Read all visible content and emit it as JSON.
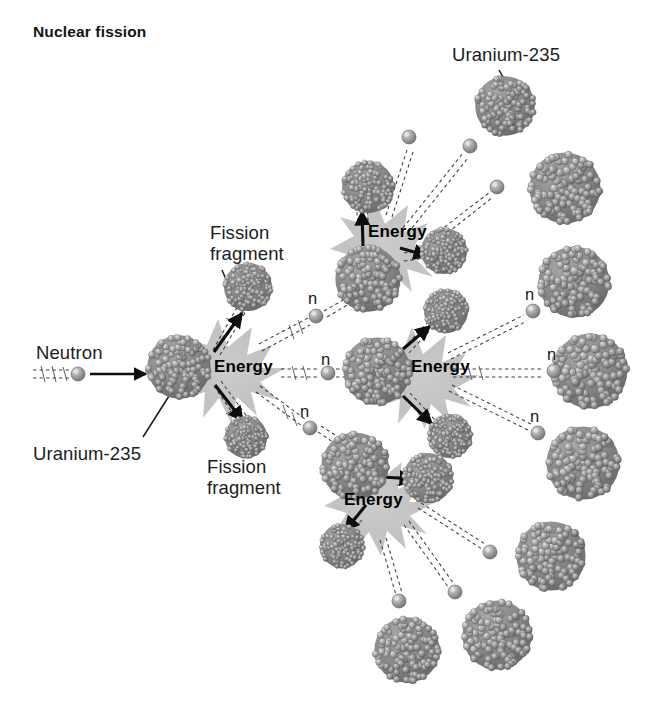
{
  "figure": {
    "title": "Nuclear fission",
    "domain_kind": "diagram",
    "background_color": "#ffffff",
    "nucleus_color": "#7e7e7e",
    "nucleus_highlight_color": "#b9b9b9",
    "burst_color": "#bdbdbd",
    "arrow_color": "#0d0d0d",
    "text_color": "#141414"
  },
  "labels": {
    "neutron": "Neutron",
    "uranium_left": "Uranium-235",
    "uranium_top": "Uranium-235",
    "fission_fragment_top": "Fission\nfragment",
    "fission_fragment_top_line1": "Fission",
    "fission_fragment_top_line2": "fragment",
    "fission_fragment_bottom_line1": "Fission",
    "fission_fragment_bottom_line2": "fragment",
    "energy_1": "Energy",
    "energy_2": "Energy",
    "energy_3": "Energy",
    "energy_4": "Energy",
    "neutron_symbol_1": "n",
    "neutron_symbol_2": "n",
    "neutron_symbol_3": "n",
    "neutron_symbol_4": "n",
    "neutron_symbol_5": "n",
    "neutron_symbol_6": "n"
  },
  "chart_data": {
    "type": "diagram",
    "title": "Nuclear fission",
    "subtitle": "",
    "generations": 3,
    "neutrons_released_per_fission": 3,
    "fission_events": [
      {
        "id": "fission-1",
        "generation": 1,
        "energy_label": "Energy",
        "nucleus": {
          "cx": 179,
          "cy": 367,
          "r": 33
        },
        "burst": {
          "cx": 218,
          "cy": 367,
          "r": 48
        },
        "fragments": [
          {
            "cx": 248,
            "cy": 287,
            "r": 25
          },
          {
            "cx": 246,
            "cy": 437,
            "r": 22
          }
        ],
        "emitted_neutrons": [
          "n-1",
          "n-2",
          "n-3"
        ]
      },
      {
        "id": "fission-2",
        "generation": 2,
        "energy_label": "Energy",
        "nucleus": {
          "cx": 368,
          "cy": 279,
          "r": 34
        },
        "burst": {
          "cx": 374,
          "cy": 243,
          "r": 46
        },
        "fragments": [
          {
            "cx": 368,
            "cy": 187,
            "r": 27
          },
          {
            "cx": 444,
            "cy": 251,
            "r": 24
          }
        ],
        "emitted_neutrons": [
          "n-4",
          "n-top-a",
          "n-top-b"
        ]
      },
      {
        "id": "fission-3",
        "generation": 2,
        "energy_label": "Energy",
        "nucleus": {
          "cx": 377,
          "cy": 371,
          "r": 35
        },
        "burst": {
          "cx": 412,
          "cy": 373,
          "r": 46
        },
        "fragments": [
          {
            "cx": 446,
            "cy": 311,
            "r": 23
          },
          {
            "cx": 450,
            "cy": 436,
            "r": 23
          }
        ],
        "emitted_neutrons": [
          "n-5",
          "n-6"
        ]
      },
      {
        "id": "fission-4",
        "generation": 2,
        "energy_label": "Energy",
        "nucleus": {
          "cx": 355,
          "cy": 466,
          "r": 35
        },
        "burst": {
          "cx": 368,
          "cy": 500,
          "r": 46
        },
        "fragments": [
          {
            "cx": 428,
            "cy": 478,
            "r": 26
          },
          {
            "cx": 342,
            "cy": 546,
            "r": 23
          }
        ],
        "emitted_neutrons": [
          "n-bot-a",
          "n-bot-b",
          "n-bot-c"
        ]
      }
    ],
    "incoming_neutron": {
      "label": "Neutron",
      "trail_start_x": 33,
      "trail_end_x": 70,
      "sphere": {
        "cx": 78,
        "cy": 374,
        "r": 7
      },
      "arrow_from_x": 90,
      "arrow_to_x": 148,
      "arrow_y": 374
    },
    "free_neutrons": [
      {
        "id": "n-1",
        "label": "n",
        "cx": 316,
        "cy": 316,
        "r": 7
      },
      {
        "id": "n-2",
        "label": "n",
        "cx": 328,
        "cy": 373,
        "r": 7
      },
      {
        "id": "n-3",
        "label": "n",
        "cx": 310,
        "cy": 428,
        "r": 7
      },
      {
        "id": "n-4",
        "label": "n",
        "cx": 533,
        "cy": 311,
        "r": 7
      },
      {
        "id": "n-5",
        "label": "n",
        "cx": 554,
        "cy": 371,
        "r": 7
      },
      {
        "id": "n-6",
        "label": "n",
        "cx": 538,
        "cy": 433,
        "r": 7
      },
      {
        "id": "n-top-a",
        "label": "",
        "cx": 409,
        "cy": 137,
        "r": 7
      },
      {
        "id": "n-top-b",
        "label": "",
        "cx": 470,
        "cy": 146,
        "r": 7
      },
      {
        "id": "n-top-c",
        "label": "",
        "cx": 497,
        "cy": 187,
        "r": 7
      },
      {
        "id": "n-bot-a",
        "label": "",
        "cx": 490,
        "cy": 552,
        "r": 7
      },
      {
        "id": "n-bot-b",
        "label": "",
        "cx": 455,
        "cy": 592,
        "r": 7
      },
      {
        "id": "n-bot-c",
        "label": "",
        "cx": 399,
        "cy": 601,
        "r": 7
      }
    ],
    "unreacted_nuclei": [
      {
        "cx": 505,
        "cy": 106,
        "r": 31
      },
      {
        "cx": 565,
        "cy": 188,
        "r": 37
      },
      {
        "cx": 574,
        "cy": 282,
        "r": 37
      },
      {
        "cx": 590,
        "cy": 371,
        "r": 39
      },
      {
        "cx": 583,
        "cy": 463,
        "r": 38
      },
      {
        "cx": 551,
        "cy": 556,
        "r": 36
      },
      {
        "cx": 497,
        "cy": 635,
        "r": 36
      },
      {
        "cx": 407,
        "cy": 650,
        "r": 34
      }
    ]
  }
}
